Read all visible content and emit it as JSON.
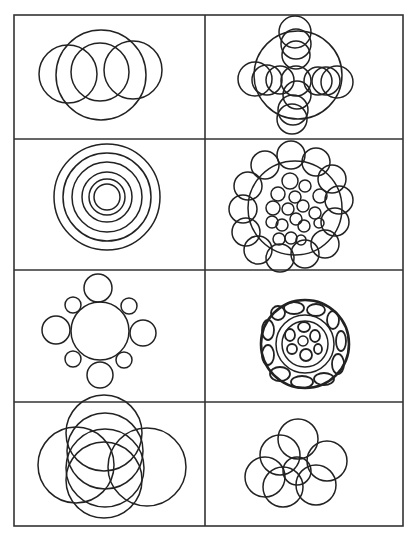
{
  "diagram": {
    "title": "",
    "stroke_color": "#222222",
    "grid_color": "#333333",
    "grid": {
      "left": 14,
      "right": 403,
      "top": 15,
      "bottom": 526,
      "col_divider": 205,
      "row_dividers": [
        139,
        270,
        402
      ]
    },
    "panels": [
      {
        "id": "overlapping-four-circles",
        "description": "Large circle with three overlapping smaller circles in a row",
        "circles": [
          {
            "cx": 101,
            "cy": 75,
            "r": 45
          },
          {
            "cx": 68,
            "cy": 74,
            "r": 29
          },
          {
            "cx": 100,
            "cy": 72,
            "r": 29
          },
          {
            "cx": 133,
            "cy": 70,
            "r": 29
          }
        ]
      },
      {
        "id": "cross-of-circles",
        "description": "Large circle with circles arranged in a cross pattern",
        "circles": [
          {
            "cx": 298,
            "cy": 75,
            "r": 44
          },
          {
            "cx": 295,
            "cy": 32,
            "r": 16
          },
          {
            "cx": 296,
            "cy": 44,
            "r": 15
          },
          {
            "cx": 296,
            "cy": 55,
            "r": 14
          },
          {
            "cx": 296,
            "cy": 81,
            "r": 15
          },
          {
            "cx": 297,
            "cy": 95,
            "r": 14
          },
          {
            "cx": 293,
            "cy": 110,
            "r": 15
          },
          {
            "cx": 292,
            "cy": 119,
            "r": 15
          },
          {
            "cx": 255,
            "cy": 79,
            "r": 17
          },
          {
            "cx": 267,
            "cy": 80,
            "r": 15
          },
          {
            "cx": 280,
            "cy": 80,
            "r": 14
          },
          {
            "cx": 318,
            "cy": 81,
            "r": 14
          },
          {
            "cx": 326,
            "cy": 81,
            "r": 14
          },
          {
            "cx": 337,
            "cy": 82,
            "r": 16
          }
        ]
      },
      {
        "id": "concentric-circles",
        "description": "Six concentric circles",
        "circles": [
          {
            "cx": 107,
            "cy": 197,
            "r": 53
          },
          {
            "cx": 107,
            "cy": 197,
            "r": 44
          },
          {
            "cx": 107,
            "cy": 197,
            "r": 35
          },
          {
            "cx": 107,
            "cy": 197,
            "r": 25
          },
          {
            "cx": 107,
            "cy": 197,
            "r": 18
          },
          {
            "cx": 107,
            "cy": 197,
            "r": 13
          }
        ]
      },
      {
        "id": "clustered-circles",
        "description": "Ring of outer circles around a dense cluster of small circles",
        "circles": [
          {
            "cx": 295,
            "cy": 208,
            "r": 47
          },
          {
            "cx": 291,
            "cy": 155,
            "r": 14
          },
          {
            "cx": 316,
            "cy": 162,
            "r": 14
          },
          {
            "cx": 332,
            "cy": 179,
            "r": 14
          },
          {
            "cx": 339,
            "cy": 200,
            "r": 14
          },
          {
            "cx": 335,
            "cy": 222,
            "r": 14
          },
          {
            "cx": 325,
            "cy": 244,
            "r": 14
          },
          {
            "cx": 305,
            "cy": 254,
            "r": 14
          },
          {
            "cx": 280,
            "cy": 258,
            "r": 14
          },
          {
            "cx": 258,
            "cy": 250,
            "r": 14
          },
          {
            "cx": 246,
            "cy": 232,
            "r": 14
          },
          {
            "cx": 243,
            "cy": 209,
            "r": 14
          },
          {
            "cx": 248,
            "cy": 186,
            "r": 14
          },
          {
            "cx": 265,
            "cy": 165,
            "r": 14
          },
          {
            "cx": 290,
            "cy": 181,
            "r": 8
          },
          {
            "cx": 305,
            "cy": 186,
            "r": 6
          },
          {
            "cx": 320,
            "cy": 196,
            "r": 7
          },
          {
            "cx": 278,
            "cy": 194,
            "r": 7
          },
          {
            "cx": 295,
            "cy": 197,
            "r": 6
          },
          {
            "cx": 273,
            "cy": 208,
            "r": 7
          },
          {
            "cx": 288,
            "cy": 209,
            "r": 6
          },
          {
            "cx": 303,
            "cy": 206,
            "r": 6
          },
          {
            "cx": 315,
            "cy": 213,
            "r": 6
          },
          {
            "cx": 272,
            "cy": 222,
            "r": 6
          },
          {
            "cx": 282,
            "cy": 225,
            "r": 6
          },
          {
            "cx": 296,
            "cy": 219,
            "r": 6
          },
          {
            "cx": 304,
            "cy": 226,
            "r": 6
          },
          {
            "cx": 319,
            "cy": 223,
            "r": 5
          },
          {
            "cx": 279,
            "cy": 239,
            "r": 6
          },
          {
            "cx": 291,
            "cy": 238,
            "r": 6
          },
          {
            "cx": 301,
            "cy": 240,
            "r": 5
          }
        ]
      },
      {
        "id": "satellite-circles",
        "description": "Central circle with eight non-overlapping satellite circles",
        "circles": [
          {
            "cx": 100,
            "cy": 331,
            "r": 29
          },
          {
            "cx": 98,
            "cy": 288,
            "r": 14
          },
          {
            "cx": 73,
            "cy": 305,
            "r": 8
          },
          {
            "cx": 129,
            "cy": 306,
            "r": 8
          },
          {
            "cx": 56,
            "cy": 330,
            "r": 14
          },
          {
            "cx": 143,
            "cy": 333,
            "r": 13
          },
          {
            "cx": 73,
            "cy": 359,
            "r": 8
          },
          {
            "cx": 124,
            "cy": 360,
            "r": 8
          },
          {
            "cx": 100,
            "cy": 375,
            "r": 13
          }
        ]
      },
      {
        "id": "rosette-circle",
        "description": "Circle filled with ring of ovals around an inner flower of ovals",
        "circles": [
          {
            "cx": 305,
            "cy": 344,
            "r": 44,
            "thick": true
          },
          {
            "cx": 305,
            "cy": 344,
            "r": 29
          },
          {
            "cx": 305,
            "cy": 344,
            "r": 23
          },
          {
            "cx": 303,
            "cy": 341,
            "r": 5
          }
        ],
        "ellipses": [
          {
            "cx": 294,
            "cy": 308,
            "rx": 10,
            "ry": 6
          },
          {
            "cx": 316,
            "cy": 310,
            "rx": 9,
            "ry": 6
          },
          {
            "cx": 333,
            "cy": 320,
            "rx": 6,
            "ry": 9
          },
          {
            "cx": 341,
            "cy": 341,
            "rx": 5,
            "ry": 10
          },
          {
            "cx": 338,
            "cy": 364,
            "rx": 6,
            "ry": 10
          },
          {
            "cx": 324,
            "cy": 379,
            "rx": 10,
            "ry": 6
          },
          {
            "cx": 302,
            "cy": 382,
            "rx": 11,
            "ry": 6
          },
          {
            "cx": 280,
            "cy": 374,
            "rx": 10,
            "ry": 7
          },
          {
            "cx": 268,
            "cy": 355,
            "rx": 6,
            "ry": 10
          },
          {
            "cx": 268,
            "cy": 330,
            "rx": 6,
            "ry": 10
          },
          {
            "cx": 278,
            "cy": 313,
            "rx": 7,
            "ry": 7
          },
          {
            "cx": 304,
            "cy": 327,
            "rx": 6,
            "ry": 5
          },
          {
            "cx": 315,
            "cy": 336,
            "rx": 5,
            "ry": 6
          },
          {
            "cx": 290,
            "cy": 335,
            "rx": 5,
            "ry": 6
          },
          {
            "cx": 292,
            "cy": 349,
            "rx": 5,
            "ry": 5
          },
          {
            "cx": 306,
            "cy": 355,
            "rx": 6,
            "ry": 6
          },
          {
            "cx": 318,
            "cy": 349,
            "rx": 4,
            "ry": 5
          }
        ]
      },
      {
        "id": "overlapping-petals",
        "description": "Five large overlapping circles forming a petal arrangement",
        "circles": [
          {
            "cx": 105,
            "cy": 468,
            "r": 39
          },
          {
            "cx": 147,
            "cy": 467,
            "r": 39
          },
          {
            "cx": 105,
            "cy": 451,
            "r": 38
          },
          {
            "cx": 104,
            "cy": 480,
            "r": 38
          },
          {
            "cx": 104,
            "cy": 433,
            "r": 38
          },
          {
            "cx": 76,
            "cy": 465,
            "r": 38
          }
        ]
      },
      {
        "id": "flower-of-circles",
        "description": "Seven overlapping circles arranged like a flower",
        "circles": [
          {
            "cx": 298,
            "cy": 439,
            "r": 20
          },
          {
            "cx": 280,
            "cy": 455,
            "r": 20
          },
          {
            "cx": 327,
            "cy": 461,
            "r": 20
          },
          {
            "cx": 265,
            "cy": 477,
            "r": 20
          },
          {
            "cx": 283,
            "cy": 487,
            "r": 20
          },
          {
            "cx": 316,
            "cy": 485,
            "r": 20
          },
          {
            "cx": 297,
            "cy": 471,
            "r": 14
          }
        ]
      }
    ]
  }
}
